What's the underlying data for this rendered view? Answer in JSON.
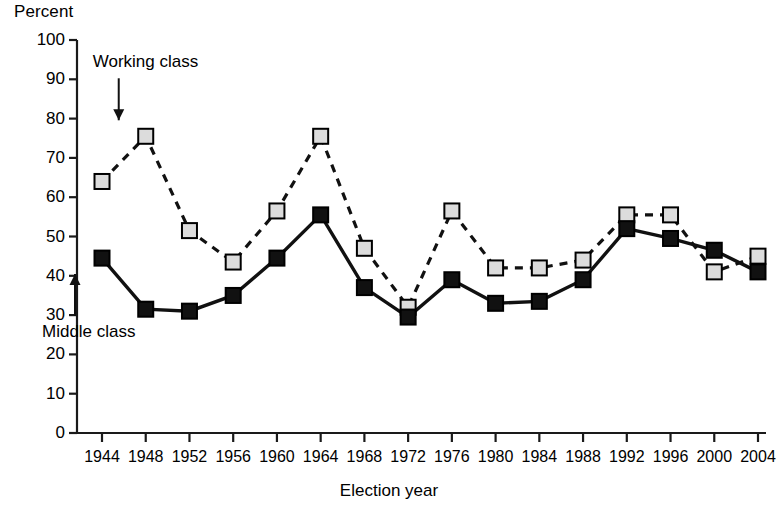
{
  "chart_data": {
    "type": "line",
    "title": "",
    "xlabel": "Election year",
    "ylabel": "Percent",
    "ylim": [
      0,
      100
    ],
    "ytick_step": 10,
    "grid": false,
    "legend_position": "inline-annotations",
    "categories": [
      1944,
      1948,
      1952,
      1956,
      1960,
      1964,
      1968,
      1972,
      1976,
      1980,
      1984,
      1988,
      1992,
      1996,
      2000,
      2004
    ],
    "xtick_labels": [
      "1944",
      "1948",
      "1952",
      "1956",
      "1960",
      "1964",
      "1968",
      "1972",
      "1976",
      "1980",
      "1984",
      "1988",
      "1992",
      "1996",
      "2000",
      "2004"
    ],
    "ytick_labels": [
      "100",
      "90",
      "80",
      "70",
      "60",
      "50",
      "40",
      "30",
      "20",
      "10",
      "0"
    ],
    "series": [
      {
        "name": "Working class",
        "marker": "square",
        "marker_fill": "#dcdcdc",
        "marker_stroke": "#000000",
        "line_style": "dashed",
        "values": [
          64,
          75.5,
          51.5,
          43.5,
          56.5,
          75.5,
          47,
          32,
          56.5,
          42,
          42,
          44,
          55.5,
          55.5,
          41,
          45
        ]
      },
      {
        "name": "Middle class",
        "marker": "square",
        "marker_fill": "#111111",
        "marker_stroke": "#000000",
        "line_style": "solid",
        "values": [
          44.5,
          31.5,
          31,
          35,
          44.5,
          55.5,
          37,
          29.5,
          39,
          33,
          33.5,
          39,
          52,
          49.5,
          46.5,
          41
        ]
      }
    ],
    "annotations": [
      {
        "label": "Working class",
        "points_to_series": "Working class",
        "points_to_year": 1948,
        "arrow": "down"
      },
      {
        "label": "Middle class",
        "points_to_series": "Middle class",
        "points_to_year": 1944,
        "arrow": "up"
      }
    ]
  },
  "colors": {
    "axis": "#1a1a1a",
    "working_class_marker": "#dcdcdc",
    "middle_class_marker": "#111111",
    "text": "#000000",
    "background": "#ffffff"
  }
}
